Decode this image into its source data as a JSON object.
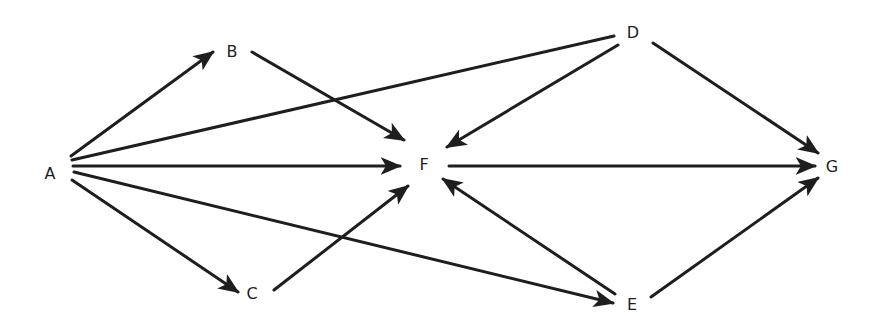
{
  "diagram": {
    "type": "directed-graph",
    "colors": {
      "stroke": "#1e1e1e",
      "background": "#ffffff",
      "text": "#1e1e1e"
    },
    "nodes": [
      {
        "id": "A",
        "label": "A",
        "x": 50,
        "y": 173
      },
      {
        "id": "B",
        "label": "B",
        "x": 232,
        "y": 51
      },
      {
        "id": "C",
        "label": "C",
        "x": 252,
        "y": 293
      },
      {
        "id": "D",
        "label": "D",
        "x": 633,
        "y": 32
      },
      {
        "id": "E",
        "label": "E",
        "x": 632,
        "y": 304
      },
      {
        "id": "F",
        "label": "F",
        "x": 424,
        "y": 164
      },
      {
        "id": "G",
        "label": "G",
        "x": 832,
        "y": 166
      }
    ],
    "edges": [
      {
        "from": "A",
        "to": "B",
        "arrow": true,
        "x1": 71,
        "y1": 156,
        "x2": 213,
        "y2": 52
      },
      {
        "from": "A",
        "to": "D",
        "arrow": false,
        "x1": 72,
        "y1": 160,
        "x2": 614,
        "y2": 36
      },
      {
        "from": "A",
        "to": "F",
        "arrow": true,
        "x1": 73,
        "y1": 166,
        "x2": 400,
        "y2": 166
      },
      {
        "from": "A",
        "to": "E",
        "arrow": true,
        "x1": 74,
        "y1": 172,
        "x2": 613,
        "y2": 303
      },
      {
        "from": "A",
        "to": "C",
        "arrow": true,
        "x1": 72,
        "y1": 180,
        "x2": 238,
        "y2": 292
      },
      {
        "from": "B",
        "to": "F",
        "arrow": true,
        "x1": 252,
        "y1": 52,
        "x2": 404,
        "y2": 140
      },
      {
        "from": "C",
        "to": "F",
        "arrow": true,
        "x1": 274,
        "y1": 290,
        "x2": 408,
        "y2": 186
      },
      {
        "from": "D",
        "to": "F",
        "arrow": true,
        "x1": 618,
        "y1": 45,
        "x2": 447,
        "y2": 147
      },
      {
        "from": "D",
        "to": "G",
        "arrow": true,
        "x1": 653,
        "y1": 43,
        "x2": 818,
        "y2": 153
      },
      {
        "from": "F",
        "to": "G",
        "arrow": true,
        "x1": 449,
        "y1": 166,
        "x2": 815,
        "y2": 166
      },
      {
        "from": "E",
        "to": "F",
        "arrow": true,
        "x1": 615,
        "y1": 294,
        "x2": 443,
        "y2": 179
      },
      {
        "from": "E",
        "to": "G",
        "arrow": true,
        "x1": 651,
        "y1": 297,
        "x2": 818,
        "y2": 178
      }
    ]
  }
}
